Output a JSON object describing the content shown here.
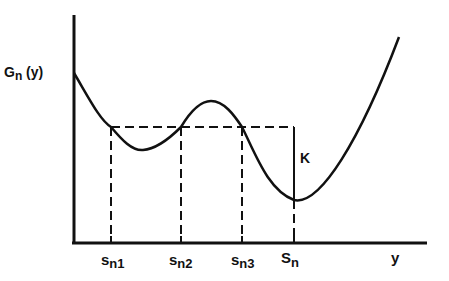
{
  "diagram": {
    "type": "function-plot",
    "y_axis_label": {
      "main": "G",
      "sub": "n",
      "suffix": " (y)"
    },
    "x_axis_label": "y",
    "x_ticks": [
      {
        "main": "s",
        "sub": "n1",
        "x": 111
      },
      {
        "main": "s",
        "sub": "n2",
        "x": 181
      },
      {
        "main": "s",
        "sub": "n3",
        "x": 242
      },
      {
        "main": "S",
        "sub": "n",
        "x": 294
      }
    ],
    "gap_label": "K",
    "colors": {
      "line": "#111111",
      "background": "#ffffff"
    }
  }
}
